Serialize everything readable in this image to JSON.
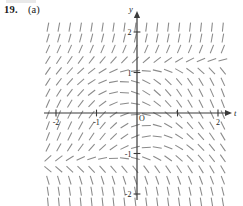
{
  "figure": {
    "problem_number": "19.",
    "part": "(a)",
    "axes": {
      "x_axis_label": "t",
      "y_axis_label": "y",
      "origin_label": "O",
      "x_ticks": [
        {
          "value": -2,
          "label": "-2"
        },
        {
          "value": -1,
          "label": "-1"
        },
        {
          "value": 1,
          "label": ""
        },
        {
          "value": 2,
          "label": "2"
        }
      ],
      "y_ticks": [
        {
          "value": 2,
          "label": "2"
        },
        {
          "value": 1,
          "label": "1"
        },
        {
          "value": -1,
          "label": "-1"
        },
        {
          "value": -2,
          "label": "-2"
        }
      ],
      "x_range": [
        -2.35,
        2.35
      ],
      "y_range": [
        -2.35,
        2.35
      ],
      "axis_color": "#3a3a3a",
      "segment_color": "#8a8a8a"
    },
    "chart_data": {
      "type": "scatter",
      "title": "",
      "xlabel": "t",
      "ylabel": "y",
      "xlim": [
        -2.35,
        2.35
      ],
      "ylim": [
        -2.35,
        2.35
      ],
      "grid": false,
      "legend": "none",
      "description": "Direction (slope) field of a first-order differential equation dy/dt = f(t,y); short tangent segments drawn on a uniform grid over -2.2..2.2 in both t and y.",
      "slope_formula": "dy/dt = y*(y*y - 1.0) - 1.15*t*(1 - 0.42*y*y)",
      "grid_t": [
        -2.2,
        -1.93,
        -1.66,
        -1.39,
        -1.12,
        -0.85,
        -0.58,
        -0.31,
        -0.04,
        0.23,
        0.5,
        0.77,
        1.04,
        1.31,
        1.58,
        1.85,
        2.12
      ],
      "grid_y": [
        -2.2,
        -1.93,
        -1.66,
        -1.39,
        -1.12,
        -0.85,
        -0.58,
        -0.31,
        -0.04,
        0.23,
        0.5,
        0.77,
        1.04,
        1.31,
        1.58,
        1.85,
        2.12
      ],
      "segment_length_px": 9.0,
      "segment_count": 289
    }
  }
}
